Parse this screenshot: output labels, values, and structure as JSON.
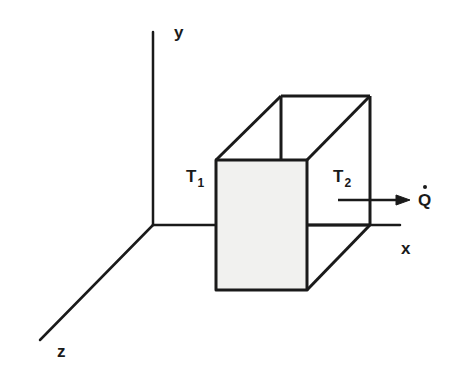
{
  "diagram": {
    "axes": {
      "y_label": "y",
      "x_label": "x",
      "z_label": "z"
    },
    "labels": {
      "t1_main": "T",
      "t1_sub": "1",
      "t2_main": "T",
      "t2_sub": "2",
      "heat_flow": "Q"
    },
    "colors": {
      "line": "#1a1a1a",
      "front_face_fill": "#f1f1ef",
      "background": "#ffffff"
    }
  }
}
